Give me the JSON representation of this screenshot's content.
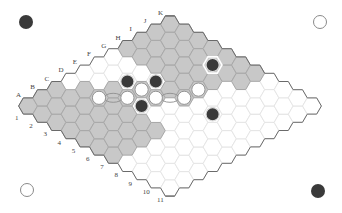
{
  "game": "Hex",
  "board": {
    "size": 11,
    "column_labels": [
      "A",
      "B",
      "C",
      "D",
      "E",
      "F",
      "G",
      "H",
      "I",
      "J",
      "K"
    ],
    "row_labels": [
      "1",
      "2",
      "3",
      "4",
      "5",
      "6",
      "7",
      "8",
      "9",
      "10",
      "11"
    ],
    "colors": {
      "cell_fill": "#ffffff",
      "cell_stroke": "#e2e2e2",
      "shaded_fill": "#c8c8c8",
      "shaded_stroke": "#a9a9a9",
      "edge_stroke": "#6a6a6a",
      "black_stone": "#3a3a3a",
      "white_stone": "#ffffff",
      "white_stone_stroke": "#8a8a8a"
    },
    "shaded_cells": [
      "A1",
      "A2",
      "A3",
      "A4",
      "A5",
      "A6",
      "A7",
      "B1",
      "B2",
      "B3",
      "B4",
      "B5",
      "B6",
      "B7",
      "C1",
      "C2",
      "C3",
      "C4",
      "C5",
      "C6",
      "C7",
      "D2",
      "D3",
      "D4",
      "D5",
      "D6",
      "D7",
      "E3",
      "E4",
      "F4",
      "F5",
      "G5",
      "G6",
      "H6",
      "I1",
      "I2",
      "I3",
      "I4",
      "I5",
      "J1",
      "J2",
      "J3",
      "J4",
      "J5",
      "J6",
      "K1",
      "K2",
      "K3",
      "K4",
      "K5",
      "K6",
      "K7",
      "H1",
      "H2",
      "H3",
      "H4",
      "H5",
      "I6",
      "J7"
    ],
    "stones": [
      {
        "cell": "F3",
        "color": "black"
      },
      {
        "cell": "G4",
        "color": "black"
      },
      {
        "cell": "E5",
        "color": "black"
      },
      {
        "cell": "J5",
        "color": "black",
        "highlighted": true
      },
      {
        "cell": "G8",
        "color": "black"
      },
      {
        "cell": "D3",
        "color": "white"
      },
      {
        "cell": "E4",
        "color": "white"
      },
      {
        "cell": "F4",
        "color": "white"
      },
      {
        "cell": "F5",
        "color": "white"
      },
      {
        "cell": "G6",
        "color": "white"
      },
      {
        "cell": "H6",
        "color": "white"
      }
    ],
    "links": [
      [
        "D3",
        "E4"
      ],
      [
        "F5",
        "G6"
      ]
    ]
  },
  "corner_markers": [
    {
      "position": "top-left",
      "color": "black"
    },
    {
      "position": "top-right",
      "color": "white"
    },
    {
      "position": "bottom-left",
      "color": "white"
    },
    {
      "position": "bottom-right",
      "color": "black"
    }
  ]
}
